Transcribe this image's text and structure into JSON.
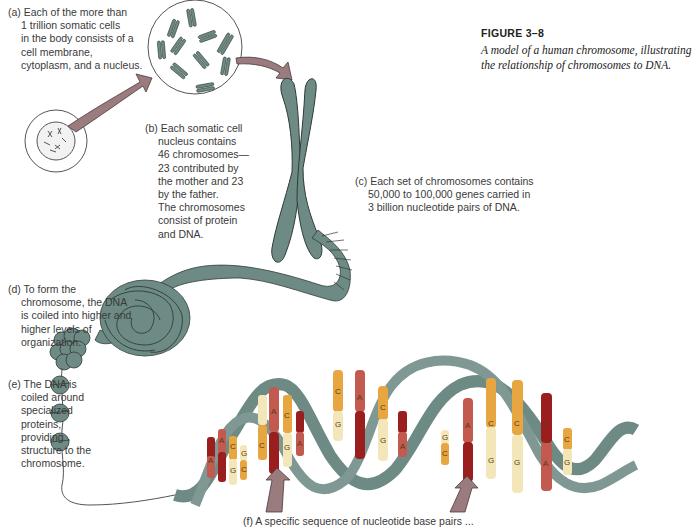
{
  "figure": {
    "number": "FIGURE 3–8",
    "caption_lines": [
      "A model of a human chromosome, illustrating",
      "the relationship of chromosomes to DNA."
    ]
  },
  "labels": {
    "a": {
      "lines": [
        "(a) Each of the more than",
        "1 trillion somatic cells",
        "in the body consists of a",
        "cell membrane,",
        "cytoplasm, and a nucleus."
      ]
    },
    "b": {
      "lines": [
        "(b) Each somatic cell",
        "nucleus contains",
        "46 chromosomes—",
        "23 contributed by",
        "the mother and 23",
        "by the father.",
        "The chromosomes",
        "consist of protein",
        "and DNA."
      ]
    },
    "c": {
      "lines": [
        "(c) Each set of chromosomes contains",
        "50,000 to 100,000 genes carried in",
        "3 billion nucleotide pairs of DNA."
      ]
    },
    "d": {
      "lines": [
        "(d) To form the",
        "chromosome, the DNA",
        "is coiled into higher and",
        "higher levels of",
        "organization."
      ]
    },
    "e": {
      "lines": [
        "(e) The DNA is",
        "coiled around",
        "specialized",
        "proteins,",
        "providing",
        "structure to the",
        "chromosome."
      ]
    },
    "f": {
      "lines": [
        "(f) A specific sequence of nucleotide base pairs ..."
      ]
    }
  },
  "dna_bases": {
    "pairs": [
      [
        "T",
        "A"
      ],
      [
        "A",
        "T"
      ],
      [
        "C",
        "G"
      ],
      [
        "G",
        "C"
      ],
      [
        "T",
        "A"
      ],
      [
        "A",
        "T"
      ],
      [
        "C",
        "G"
      ],
      [
        "T",
        "A"
      ],
      [
        "C",
        "G"
      ],
      [
        "A",
        "T"
      ],
      [
        "C",
        "G"
      ],
      [
        "T",
        "A"
      ],
      [
        "G",
        "C"
      ],
      [
        "A",
        "T"
      ],
      [
        "C",
        "G"
      ],
      [
        "T",
        "A"
      ],
      [
        "C",
        "G"
      ]
    ]
  },
  "colors": {
    "chromosome": "#6e8a84",
    "chromosome_outline": "#2e3b38",
    "arrow": "#9a7b7e",
    "base_A": "#c25a50",
    "base_T": "#9a1e1e",
    "base_C": "#e8a640",
    "base_G": "#f3e7b9"
  }
}
